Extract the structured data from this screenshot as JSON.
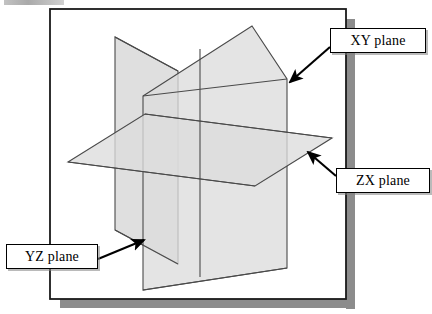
{
  "figure": {
    "background_color": "#ffffff",
    "frame": {
      "border_color": "#1a1a1a",
      "shadow_color": "#8c8c8c",
      "x": 50,
      "y": 9,
      "width": 296,
      "height": 290
    }
  },
  "planes": [
    {
      "id": "yz-plane",
      "label": "YZ plane",
      "fill": "#dcdcdc",
      "stroke": "#4a4a4a",
      "points": "115,37 115,230 178,264 178,71"
    },
    {
      "id": "zx-plane",
      "label": "ZX plane",
      "fill": "#dcdcdc",
      "stroke": "#4a4a4a",
      "points": "68,162 145,114 332,138 255,186"
    },
    {
      "id": "xy-plane",
      "label": "XY plane",
      "fill": "#dcdcdc",
      "stroke": "#4a4a4a",
      "points": "143,96 252,26 287,79 287,268 143,290"
    }
  ],
  "callouts": [
    {
      "id": "xy",
      "text": "XY plane",
      "box": {
        "x": 330,
        "y": 28,
        "width": 96,
        "height": 25
      },
      "arrow": {
        "from_x": 330,
        "from_y": 47,
        "to_x": 287,
        "to_y": 84
      }
    },
    {
      "id": "zx",
      "text": "ZX plane",
      "box": {
        "x": 336,
        "y": 168,
        "width": 94,
        "height": 25
      },
      "arrow": {
        "from_x": 336,
        "from_y": 175,
        "to_x": 306,
        "to_y": 153
      }
    },
    {
      "id": "yz",
      "text": "YZ plane",
      "box": {
        "x": 6,
        "y": 244,
        "width": 92,
        "height": 25
      },
      "arrow": {
        "from_x": 98,
        "from_y": 258,
        "to_x": 146,
        "to_y": 240
      }
    }
  ],
  "colors": {
    "plane_fill": "#dcdcdc",
    "plane_fill_overlap": "#c9c9c9",
    "plane_stroke": "#4a4a4a",
    "frame_border": "#1a1a1a",
    "frame_shadow": "#8c8c8c",
    "label_border": "#000000",
    "label_text": "#000000",
    "arrow": "#000000"
  }
}
